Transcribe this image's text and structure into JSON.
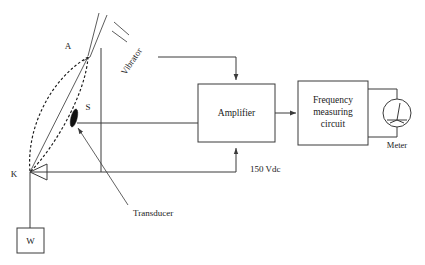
{
  "diagram": {
    "background_color": "#ffffff",
    "line_color": "#3a3a3a",
    "blocks": [
      {
        "id": "amplifier",
        "label": "Amplifier"
      },
      {
        "id": "frequency",
        "label_line1": "Frequency",
        "label_line2": "measuring",
        "label_line3": "circuit"
      }
    ],
    "labels": {
      "point_a": "A",
      "point_s": "S",
      "point_k": "K",
      "weight": "W",
      "vibrator": "Vibrator",
      "transducer": "Transducer",
      "supply_voltage": "150 Vdc",
      "meter": "Meter"
    }
  }
}
